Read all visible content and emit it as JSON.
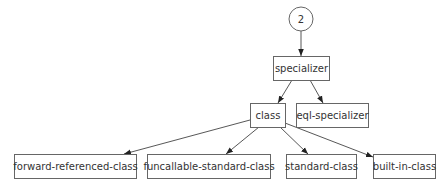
{
  "diagram": {
    "type": "class-hierarchy-graph",
    "root": {
      "id": "root",
      "label": "2",
      "shape": "circle",
      "cx": 301,
      "cy": 19,
      "r": 12
    },
    "nodes": [
      {
        "id": "specializer",
        "label": "specializer",
        "x": 273,
        "y": 56,
        "w": 56,
        "h": 24
      },
      {
        "id": "class",
        "label": "class",
        "x": 250,
        "y": 103,
        "w": 35,
        "h": 24
      },
      {
        "id": "eql-specializer",
        "label": "eql-specializer",
        "x": 296,
        "y": 103,
        "w": 72,
        "h": 24
      },
      {
        "id": "forward-referenced-class",
        "label": "forward-referenced-class",
        "x": 14,
        "y": 154,
        "w": 122,
        "h": 24
      },
      {
        "id": "funcallable-standard-class",
        "label": "funcallable-standard-class",
        "x": 147,
        "y": 154,
        "w": 123,
        "h": 24
      },
      {
        "id": "standard-class",
        "label": "standard-class",
        "x": 286,
        "y": 154,
        "w": 70,
        "h": 24
      },
      {
        "id": "built-in-class",
        "label": "built-in-class",
        "x": 373,
        "y": 154,
        "w": 62,
        "h": 24
      }
    ],
    "edges": [
      {
        "from": "root",
        "to": "specializer"
      },
      {
        "from": "specializer",
        "to": "class"
      },
      {
        "from": "specializer",
        "to": "eql-specializer"
      },
      {
        "from": "class",
        "to": "forward-referenced-class"
      },
      {
        "from": "class",
        "to": "funcallable-standard-class"
      },
      {
        "from": "class",
        "to": "standard-class"
      },
      {
        "from": "class",
        "to": "built-in-class"
      }
    ]
  }
}
